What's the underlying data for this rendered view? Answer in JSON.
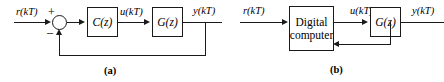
{
  "figure": {
    "stroke_color": "#1a1a1a",
    "background_color": "#ffffff"
  },
  "panel_a": {
    "caption": "(a)",
    "input_label": "r(kT)",
    "plus_sign": "+",
    "minus_sign": "–",
    "controller_block_label": "C(z)",
    "controller_output_label": "u(kT)",
    "plant_block_label": "G(z)",
    "output_label": "y(kT)"
  },
  "panel_b": {
    "caption": "(b)",
    "input_label": "r(kT)",
    "computer_block_line1": "Digital",
    "computer_block_line2": "computer",
    "computer_output_label": "u(kT)",
    "plant_block_label": "G(z)",
    "output_label": "y(kT)"
  }
}
